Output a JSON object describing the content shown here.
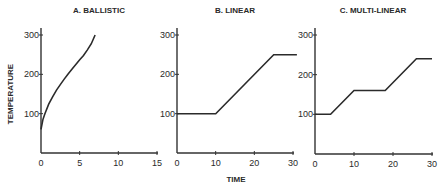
{
  "chart_data": {
    "type": "line",
    "ylabel": "TEMPERATURE",
    "xlabel": "TIME",
    "panels": [
      {
        "title": "A. BALLISTIC",
        "xlim": [
          0,
          15
        ],
        "ylim": [
          0,
          320
        ],
        "xticks": [
          0,
          5,
          10,
          15
        ],
        "yticks": [
          100,
          200,
          300
        ],
        "curve": "ballistic",
        "x": [
          0,
          0.25,
          0.5,
          1,
          1.5,
          2,
          2.5,
          3,
          3.5,
          4,
          4.5,
          5,
          5.5,
          6,
          6.5,
          7
        ],
        "y": [
          60,
          85,
          100,
          124,
          143,
          160,
          174,
          188,
          201,
          213,
          225,
          237,
          248,
          262,
          278,
          300
        ]
      },
      {
        "title": "B. LINEAR",
        "xlim": [
          0,
          30
        ],
        "ylim": [
          0,
          320
        ],
        "xticks": [
          0,
          10,
          20,
          30
        ],
        "yticks": [
          100,
          200,
          300
        ],
        "curve": "linear",
        "x": [
          0,
          10,
          25,
          31
        ],
        "y": [
          100,
          100,
          250,
          250
        ]
      },
      {
        "title": "C. MULTI-LINEAR",
        "xlim": [
          0,
          30
        ],
        "ylim": [
          0,
          320
        ],
        "xticks": [
          0,
          10,
          20,
          30
        ],
        "yticks": [
          100,
          200,
          300
        ],
        "curve": "multi-linear",
        "x": [
          0,
          4,
          10,
          18,
          26,
          30
        ],
        "y": [
          100,
          100,
          160,
          160,
          240,
          240
        ]
      }
    ]
  }
}
